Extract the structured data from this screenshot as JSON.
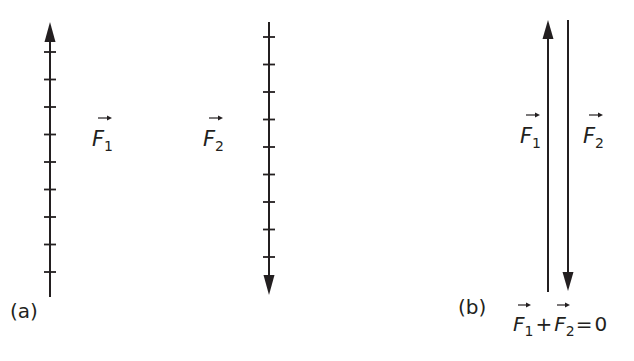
{
  "figure": {
    "stroke_color": "#231f20",
    "background": "#ffffff",
    "panel_a": {
      "label": "(a)",
      "vector_1": {
        "symbol": "F",
        "subscript": "1",
        "direction": "up",
        "tick_count": 9
      },
      "vector_2": {
        "symbol": "F",
        "subscript": "2",
        "direction": "down",
        "tick_count": 9
      }
    },
    "panel_b": {
      "label": "(b)",
      "vector_1": {
        "symbol": "F",
        "subscript": "1",
        "direction": "up"
      },
      "vector_2": {
        "symbol": "F",
        "subscript": "2",
        "direction": "down"
      },
      "equation": {
        "term1_symbol": "F",
        "term1_subscript": "1",
        "operator": "+",
        "term2_symbol": "F",
        "term2_subscript": "2",
        "equals": "=",
        "result": "0"
      }
    }
  }
}
